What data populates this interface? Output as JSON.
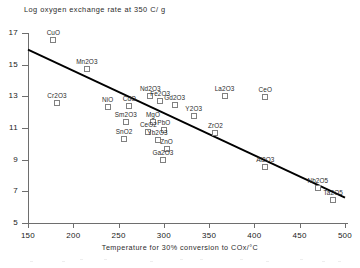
{
  "chart_data": {
    "type": "scatter",
    "title": "Log oxygen exchange rate at 350 C/ g",
    "xlabel": "Temperature for 30% conversion to COx/°C",
    "ylabel": "",
    "xlim": [
      150,
      500
    ],
    "ylim": [
      5,
      17
    ],
    "grid": false,
    "legend": "none",
    "xticks": [
      "150",
      "200",
      "250",
      "300",
      "350",
      "400",
      "450",
      "500"
    ],
    "yticks": [
      "17",
      "15",
      "13",
      "11",
      "9",
      "7",
      "5"
    ],
    "points": [
      {
        "label": "CuO",
        "x": 178,
        "y": 16.55
      },
      {
        "label": "Mn2O3",
        "x": 215,
        "y": 14.75
      },
      {
        "label": "Cr2O3",
        "x": 182,
        "y": 12.55
      },
      {
        "label": "NiO",
        "x": 238,
        "y": 12.3
      },
      {
        "label": "CdO",
        "x": 262,
        "y": 12.4
      },
      {
        "label": "Nd2O3",
        "x": 285,
        "y": 13.05
      },
      {
        "label": "Fe2O3",
        "x": 296,
        "y": 12.7
      },
      {
        "label": "Gd2O3",
        "x": 312,
        "y": 12.45
      },
      {
        "label": "La2O3",
        "x": 367,
        "y": 13.05
      },
      {
        "label": "CeO",
        "x": 412,
        "y": 12.95
      },
      {
        "label": "Y2O3",
        "x": 333,
        "y": 11.75
      },
      {
        "label": "Sm2O3",
        "x": 258,
        "y": 11.35
      },
      {
        "label": "MgO",
        "x": 288,
        "y": 11.35
      },
      {
        "label": "PbO",
        "x": 300,
        "y": 10.85
      },
      {
        "label": "CeO2",
        "x": 283,
        "y": 10.75
      },
      {
        "label": "Yb2O3",
        "x": 293,
        "y": 10.25
      },
      {
        "label": "ZrO2",
        "x": 357,
        "y": 10.7
      },
      {
        "label": "SnO2",
        "x": 256,
        "y": 10.3
      },
      {
        "label": "ZnO",
        "x": 303,
        "y": 9.7
      },
      {
        "label": "Ga2O3",
        "x": 299,
        "y": 8.95
      },
      {
        "label": "Al2O3",
        "x": 412,
        "y": 8.55
      },
      {
        "label": "Nb2O5",
        "x": 470,
        "y": 7.2
      },
      {
        "label": "Ta2O5",
        "x": 487,
        "y": 6.45
      }
    ],
    "trend_line": {
      "x": [
        150,
        500
      ],
      "y": [
        15.95,
        6.6
      ]
    }
  }
}
